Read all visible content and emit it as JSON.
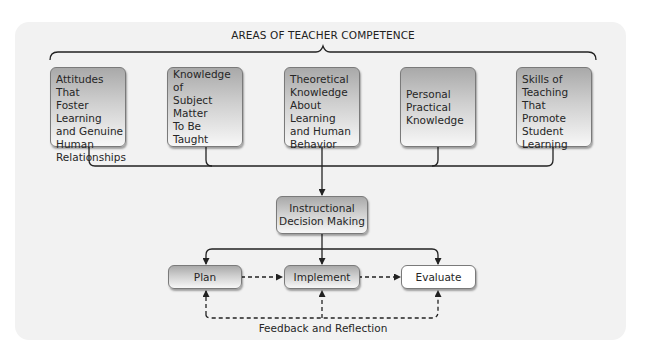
{
  "diagram": {
    "title": "AREAS OF TEACHER COMPETENCE",
    "competence_areas": [
      {
        "label": "Attitudes That\nFoster Learning\nand Genuine\nHuman\nRelationships"
      },
      {
        "label": "Knowledge of\nSubject Matter\nTo Be Taught"
      },
      {
        "label": "Theoretical\nKnowledge\nAbout Learning\nand Human\nBehavior"
      },
      {
        "label": "Personal\nPractical\nKnowledge"
      },
      {
        "label": "Skills of\nTeaching\nThat Promote\nStudent\nLearning"
      }
    ],
    "central_node": {
      "label": "Instructional\nDecision Making"
    },
    "steps": [
      {
        "label": "Plan"
      },
      {
        "label": "Implement"
      },
      {
        "label": "Evaluate"
      }
    ],
    "feedback_label": "Feedback and Reflection",
    "colors": {
      "panel_bg": "#f2f2f2",
      "box_gradient_top": "#a9a9a9",
      "box_gradient_bottom": "#f7f7f7",
      "line": "#222222",
      "box_border": "#7a7a7a"
    }
  }
}
